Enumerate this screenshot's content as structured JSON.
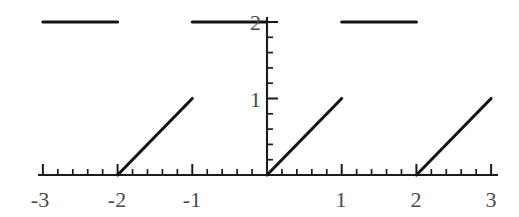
{
  "figure": {
    "title": "",
    "background_color": "#ffffff",
    "line_color": "#141414",
    "axis_color": "#1b1b1b",
    "label_color": "#4a4a4a"
  },
  "chart_data": {
    "type": "line",
    "title": "",
    "xlabel": "",
    "ylabel": "",
    "xlim": [
      -3.15,
      3.1
    ],
    "ylim": [
      -0.12,
      2.25
    ],
    "grid": false,
    "legend": false,
    "x_ticks_major": [
      -3,
      -2,
      -1,
      0,
      1,
      2,
      3
    ],
    "x_tick_labels": [
      "-3",
      "-2",
      "-1",
      "",
      "1",
      "2",
      "3"
    ],
    "y_ticks_major": [
      1,
      2
    ],
    "y_tick_labels": [
      "1",
      "2"
    ],
    "minor_ticks_per_unit": 5,
    "series": [
      {
        "name": "constant-level-2",
        "kind": "horizontal-segment",
        "value": 2,
        "segments": [
          {
            "x_start": -3,
            "x_end": -2,
            "y_start": 2,
            "y_end": 2,
            "start_marker": "closed",
            "end_marker": "open"
          },
          {
            "x_start": -1,
            "x_end": 0,
            "y_start": 2,
            "y_end": 2,
            "start_marker": "closed",
            "end_marker": "open"
          },
          {
            "x_start": 1,
            "x_end": 2,
            "y_start": 2,
            "y_end": 2,
            "start_marker": "closed",
            "end_marker": "open"
          }
        ]
      },
      {
        "name": "unit-slope-ramp",
        "kind": "ramp",
        "slope": 1,
        "segments": [
          {
            "x_start": -2,
            "x_end": -1,
            "y_start": 0,
            "y_end": 1,
            "start_marker": "closed",
            "end_marker": "open"
          },
          {
            "x_start": 0,
            "x_end": 1,
            "y_start": 0,
            "y_end": 1,
            "start_marker": "closed",
            "end_marker": "open"
          },
          {
            "x_start": 2,
            "x_end": 3,
            "y_start": 0,
            "y_end": 1,
            "start_marker": "closed",
            "end_marker": "open"
          }
        ]
      }
    ],
    "closed_points": [
      {
        "x": -3,
        "y": 2
      },
      {
        "x": -1,
        "y": 2
      },
      {
        "x": 1,
        "y": 2
      },
      {
        "x": -2,
        "y": 0
      },
      {
        "x": 0,
        "y": 0
      },
      {
        "x": 2,
        "y": 0
      }
    ],
    "open_points": [
      {
        "x": -2,
        "y": 2
      },
      {
        "x": 0,
        "y": 2
      },
      {
        "x": 2,
        "y": 2
      },
      {
        "x": -1,
        "y": 1
      },
      {
        "x": 1,
        "y": 1
      },
      {
        "x": 3,
        "y": 1
      }
    ]
  },
  "axes": {
    "x_axis_label_3_neg": "-3",
    "x_axis_label_2_neg": "-2",
    "x_axis_label_1_neg": "-1",
    "x_axis_label_1": "1",
    "x_axis_label_2": "2",
    "x_axis_label_3": "3",
    "y_axis_label_1": "1",
    "y_axis_label_2": "2"
  }
}
